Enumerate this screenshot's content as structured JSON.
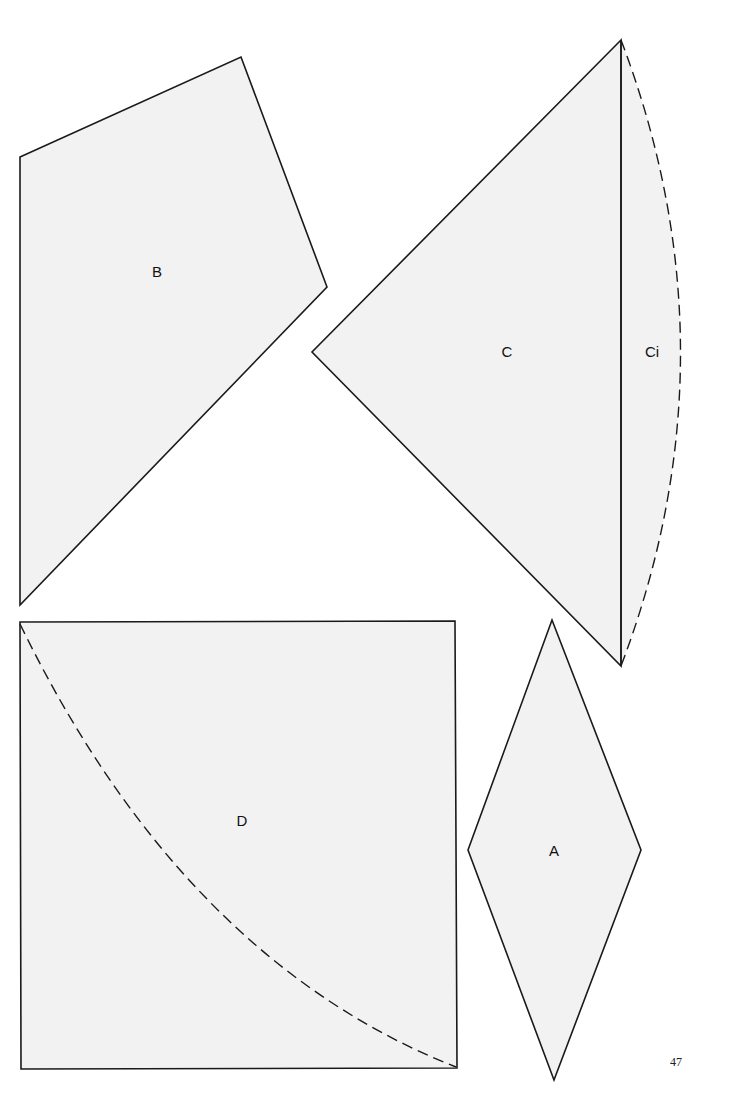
{
  "page": {
    "number": "47",
    "background": "#ffffff",
    "piece_fill": "#f2f2f2",
    "stroke_color": "#1a1a1a"
  },
  "pieces": {
    "B": {
      "label": "B",
      "shape": "pentagon"
    },
    "C": {
      "label": "C",
      "shape": "triangle"
    },
    "Ci": {
      "label": "Ci",
      "shape": "arc-segment",
      "edge": "dashed"
    },
    "D": {
      "label": "D",
      "shape": "square",
      "inner_curve": "dashed"
    },
    "A": {
      "label": "A",
      "shape": "rhombus"
    }
  }
}
